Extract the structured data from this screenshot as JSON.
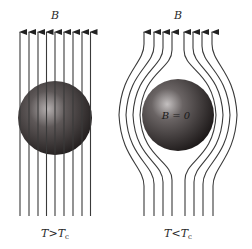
{
  "figure": {
    "panels": [
      {
        "id": "normal",
        "field_label": "B",
        "condition_label": {
          "T": "T",
          "op": ">",
          "Tc": "T",
          "sub": "c"
        },
        "interior_label": ""
      },
      {
        "id": "superconducting",
        "field_label": "B",
        "condition_label": {
          "T": "T",
          "op": "<",
          "Tc": "T",
          "sub": "c"
        },
        "interior_label": "B = 0"
      }
    ],
    "colors": {
      "background": "#ffffff",
      "field_line": "#3a3a3a",
      "sphere_dark": "#1e1a1a",
      "sphere_mid": "#5a5454",
      "sphere_highlight": "#bdb8b8"
    }
  }
}
